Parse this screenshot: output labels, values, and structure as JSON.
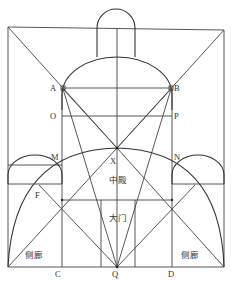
{
  "diagram": {
    "type": "architectural-proportion-diagram",
    "points": {
      "A": "A",
      "B": "B",
      "O": "O",
      "P": "P",
      "M": "M",
      "N": "N",
      "X": "X",
      "F": "F",
      "C": "C",
      "Q": "Q",
      "D": "D"
    },
    "regions": {
      "main_hall": "中殿",
      "main_gate": "大门",
      "side_aisle_left": "侧廊",
      "side_aisle_right": "侧廊"
    },
    "colors": {
      "line": "#444444",
      "background": "#ffffff"
    }
  }
}
